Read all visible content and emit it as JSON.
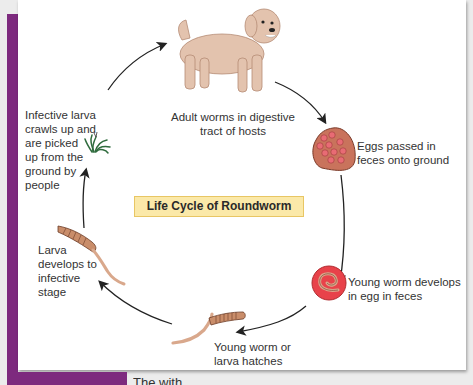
{
  "diagram": {
    "title": "Life Cycle of Roundworm",
    "stages": [
      {
        "id": "adult",
        "label": "Adult worms in digestive tract of hosts",
        "lines": [
          "Adult worms in digestive",
          "tract of hosts"
        ],
        "icon": "dog-icon"
      },
      {
        "id": "eggs",
        "label": "Eggs passed in feces onto ground",
        "lines": [
          "Eggs passed in",
          "feces onto ground"
        ],
        "icon": "egg-cluster-icon"
      },
      {
        "id": "young-egg",
        "label": "Young worm develops in egg in feces",
        "lines": [
          "Young worm develops",
          "in egg in feces"
        ],
        "icon": "egg-with-worm-icon"
      },
      {
        "id": "hatch",
        "label": "Young worm or larva hatches",
        "lines": [
          "Young worm or",
          "larva hatches"
        ],
        "icon": "larva-icon"
      },
      {
        "id": "develop",
        "label": "Larva develops to infective stage",
        "lines": [
          "Larva",
          "develops to",
          "infective",
          "stage"
        ],
        "icon": "larva-icon"
      },
      {
        "id": "infective",
        "label": "Infective larva crawls up and are picked up from the ground by people",
        "lines": [
          "Infective larva",
          "crawls up and",
          "are picked",
          "up from the",
          "ground by",
          "people"
        ],
        "icon": "grass-icon"
      }
    ],
    "colors": {
      "accent_purple": "#7d2a7e",
      "title_box_fill": "#fbe9a9",
      "title_box_border": "#e8c664",
      "egg_fill": "#e8424a",
      "egg_cluster_fill": "#c9735c",
      "worm_fill": "#d9a88c",
      "grass": "#2f6b3d",
      "dog": "#e3c3ae"
    }
  },
  "caption": {
    "partial_text": "The                               with"
  }
}
